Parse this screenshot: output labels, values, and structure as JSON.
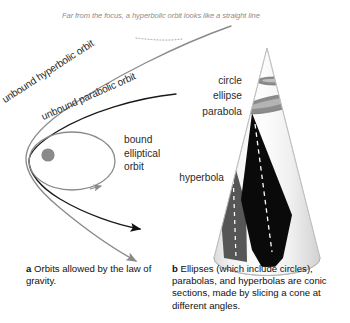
{
  "figure": {
    "background": "#ffffff"
  },
  "panel_a": {
    "letter": "a",
    "annotation": "Far from the focus, a hyperbolic orbit looks like a straight line",
    "labels": {
      "hyperbolic": "unbound hyperbolic orbit",
      "parabolic": "unbound parabolic orbit",
      "bound": "bound\nelliptical\norbit"
    },
    "caption": "Orbits allowed by the law of gravity.",
    "elements": [
      {
        "name": "focus-star",
        "type": "filled-circle",
        "color": "#8a8a8a"
      },
      {
        "name": "elliptical-orbit",
        "type": "ellipse",
        "color": "#8a8a8a"
      },
      {
        "name": "parabolic-orbit",
        "type": "curve",
        "color": "#1a1a1a"
      },
      {
        "name": "hyperbolic-orbit",
        "type": "curve",
        "color": "#6e6e6e"
      }
    ]
  },
  "panel_b": {
    "letter": "b",
    "labels": {
      "circle": "circle",
      "ellipse": "ellipse",
      "parabola": "parabola",
      "hyperbola": "hyperbola"
    },
    "caption": "Ellipses (which include circles), parabolas, and hyperbolas are conic sections, made by slicing a cone at different angles.",
    "elements": [
      {
        "name": "cone-body",
        "type": "cone",
        "color": "#ededed"
      },
      {
        "name": "circle-slice",
        "type": "ellipse-slice",
        "color": "#8c8c8c"
      },
      {
        "name": "ellipse-slice",
        "type": "ellipse-slice",
        "color": "#8c8c8c"
      },
      {
        "name": "parabola-slice",
        "type": "wedge",
        "color": "#0a0a0a"
      },
      {
        "name": "hyperbola-slice",
        "type": "wedge",
        "color": "#565656"
      }
    ]
  },
  "colors": {
    "black": "#111111",
    "gray": "#8a8a8a",
    "dark_gray": "#565656",
    "cone_light": "#f2f2f2",
    "cone_shade": "#d9d9d9",
    "note_gray": "#8d8d8d"
  }
}
